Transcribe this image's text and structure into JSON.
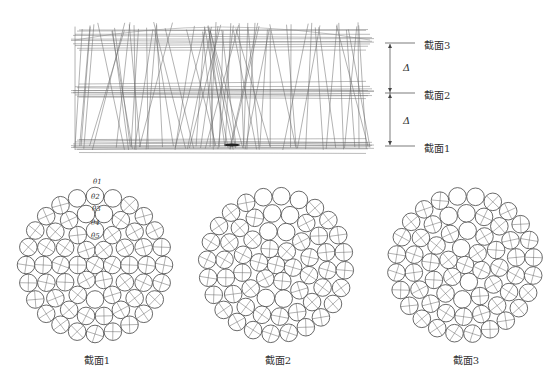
{
  "figure": {
    "top_view": {
      "description": "3D wireframe of twisted wire strands",
      "section_labels": [
        {
          "text": "截面3",
          "y": 43
        },
        {
          "text": "截面2",
          "y": 93
        },
        {
          "text": "截面1",
          "y": 146
        }
      ],
      "spacing_labels": [
        "Δ",
        "Δ"
      ]
    },
    "cross_sections": [
      {
        "caption": "截面1",
        "cx": 95,
        "cy": 265
      },
      {
        "caption": "截面2",
        "cx": 276,
        "cy": 265
      },
      {
        "caption": "截面3",
        "cx": 465,
        "cy": 265
      }
    ],
    "angle_labels": [
      "θ1",
      "θ2",
      "θ3",
      "θ4",
      "θ5"
    ],
    "colors": {
      "line": "#444444",
      "background": "#ffffff"
    }
  }
}
